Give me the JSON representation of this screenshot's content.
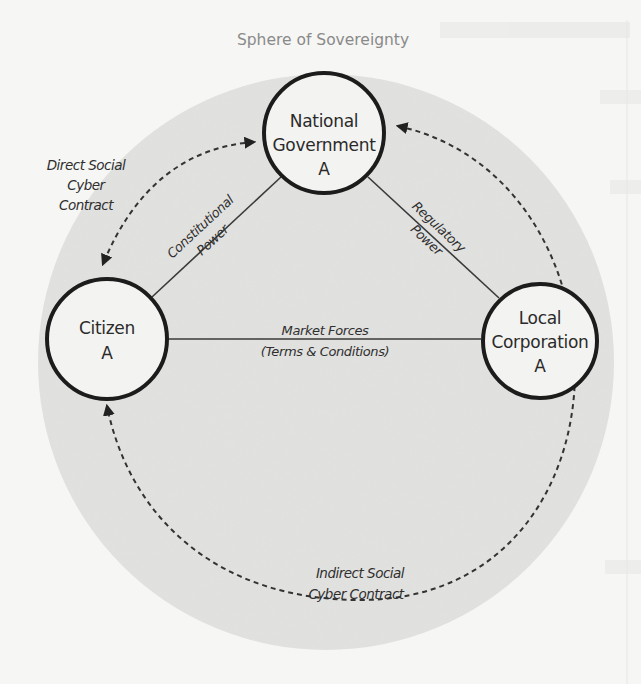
{
  "diagram": {
    "title": "Sphere of Sovereignty",
    "colors": {
      "background": "#f6f6f4",
      "sphere": "#e2e2e0",
      "node_fill": "#f3f3f1",
      "node_stroke": "#1c1c1c",
      "line": "#3a3a3a",
      "title": "#8a8a8a"
    },
    "nodes": {
      "government": {
        "line1": "National",
        "line2": "Government",
        "line3": "A"
      },
      "citizen": {
        "line1": "Citizen",
        "line2": "A"
      },
      "corporation": {
        "line1": "Local",
        "line2": "Corporation",
        "line3": "A"
      }
    },
    "edges": {
      "constitutional": {
        "line1": "Constitutional",
        "line2": "Power",
        "from": "Citizen A",
        "to": "National Government A"
      },
      "regulatory": {
        "line1": "Regulatory",
        "line2": "Power",
        "from": "National Government A",
        "to": "Local Corporation A"
      },
      "market": {
        "line1": "Market Forces",
        "line2": "(Terms & Conditions)",
        "from": "Citizen A",
        "to": "Local Corporation A"
      }
    },
    "contracts": {
      "direct": {
        "line1": "Direct Social",
        "line2": "Cyber",
        "line3": "Contract",
        "between": [
          "Citizen A",
          "National Government A"
        ],
        "style": "dashed, bidirectional"
      },
      "indirect": {
        "line1": "Indirect Social",
        "line2": "Cyber Contract",
        "between": [
          "Citizen A",
          "National Government A"
        ],
        "via": "Local Corporation A",
        "style": "dashed, bidirectional"
      }
    }
  }
}
